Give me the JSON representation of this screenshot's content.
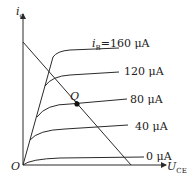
{
  "diagram": {
    "y_axis": {
      "symbol": "i",
      "subscript": "c"
    },
    "x_axis": {
      "symbol": "U",
      "subscript": "CE"
    },
    "origin_label": "O",
    "q_point_label": "Q",
    "curves": [
      {
        "prefix": "i",
        "prefix_sub": "B",
        "label": "=160 μA"
      },
      {
        "label": "120 μA"
      },
      {
        "label": "80 μA"
      },
      {
        "label": "40 μA"
      },
      {
        "label": "0 μA"
      }
    ],
    "colors": {
      "line": "#2a2a2a",
      "background": "#ffffff"
    }
  }
}
